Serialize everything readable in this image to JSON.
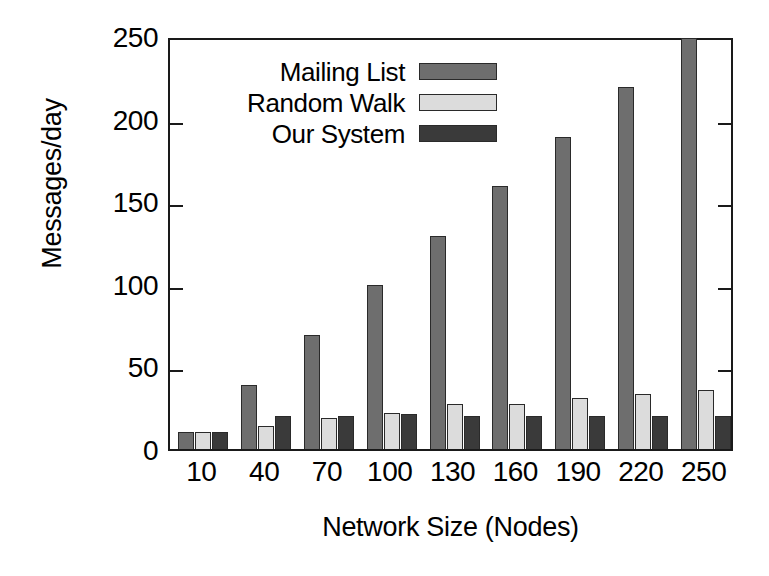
{
  "chart_data": {
    "type": "bar",
    "title": "",
    "xlabel": "Network Size (Nodes)",
    "ylabel": "Messages/day",
    "categories": [
      "10",
      "40",
      "70",
      "100",
      "130",
      "160",
      "190",
      "220",
      "250"
    ],
    "ylim": [
      0,
      250
    ],
    "yticks": [
      0,
      50,
      100,
      150,
      200,
      250
    ],
    "ytick_labels": [
      "0",
      "50",
      "100",
      "150",
      "200",
      "250"
    ],
    "grid": false,
    "legend_position": "top-center",
    "series": [
      {
        "name": "Mailing List",
        "color": "#6e6e6e",
        "values": [
          10,
          39,
          69,
          99,
          129,
          159,
          189,
          219,
          249
        ]
      },
      {
        "name": "Random Walk",
        "color": "#dcdcdc",
        "values": [
          10,
          14,
          19,
          22,
          27,
          27,
          31,
          33,
          36
        ]
      },
      {
        "name": "Our System",
        "color": "#3a3a3a",
        "values": [
          10,
          20,
          20,
          21,
          20,
          20,
          20,
          20,
          20
        ]
      }
    ]
  },
  "axes": {
    "frame_color": "#1a1a1a"
  }
}
